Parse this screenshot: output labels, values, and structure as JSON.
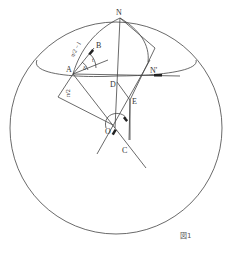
{
  "figure": {
    "caption": "図1",
    "points": {
      "N": "N",
      "N_prime": "N'",
      "A": "A",
      "B": "B",
      "D": "D",
      "E": "E",
      "O": "O",
      "C": "C"
    },
    "angle_labels": {
      "arc_AN": "π/2 − l",
      "delta": "δ",
      "t": "t",
      "right_angle": "π/2"
    },
    "colors": {
      "line": "#444444",
      "background": "#ffffff"
    }
  }
}
